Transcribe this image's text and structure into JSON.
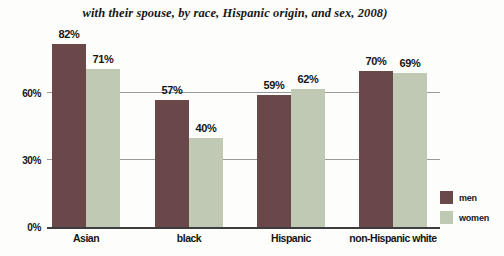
{
  "title": "with their spouse, by race, Hispanic origin, and sex, 2008)",
  "legend": {
    "men_label": "men",
    "women_label": "women"
  },
  "colors": {
    "men": "#6a4749",
    "women": "#bfc9b4",
    "gridline": "#9a9a9a",
    "axis": "#3d3d3d",
    "background": "#fdfdfc"
  },
  "chart_data": {
    "type": "bar",
    "categories": [
      "Asian",
      "black",
      "Hispanic",
      "non-Hispanic white"
    ],
    "series": [
      {
        "name": "men",
        "values": [
          82,
          57,
          59,
          70
        ]
      },
      {
        "name": "women",
        "values": [
          71,
          40,
          62,
          69
        ]
      }
    ],
    "value_label_format": "percent",
    "value_labels": {
      "men": [
        "82%",
        "57%",
        "59%",
        "70%"
      ],
      "women": [
        "71%",
        "40%",
        "62%",
        "69%"
      ]
    },
    "title": "with their spouse, by race, Hispanic origin, and sex, 2008)",
    "xlabel": "",
    "ylabel": "",
    "ylim": [
      0,
      90
    ],
    "yticks": [
      0,
      30,
      60
    ],
    "ytick_labels": [
      "0%",
      "30%",
      "60%"
    ],
    "grid": "horizontal",
    "legend_position": "bottom-right"
  }
}
